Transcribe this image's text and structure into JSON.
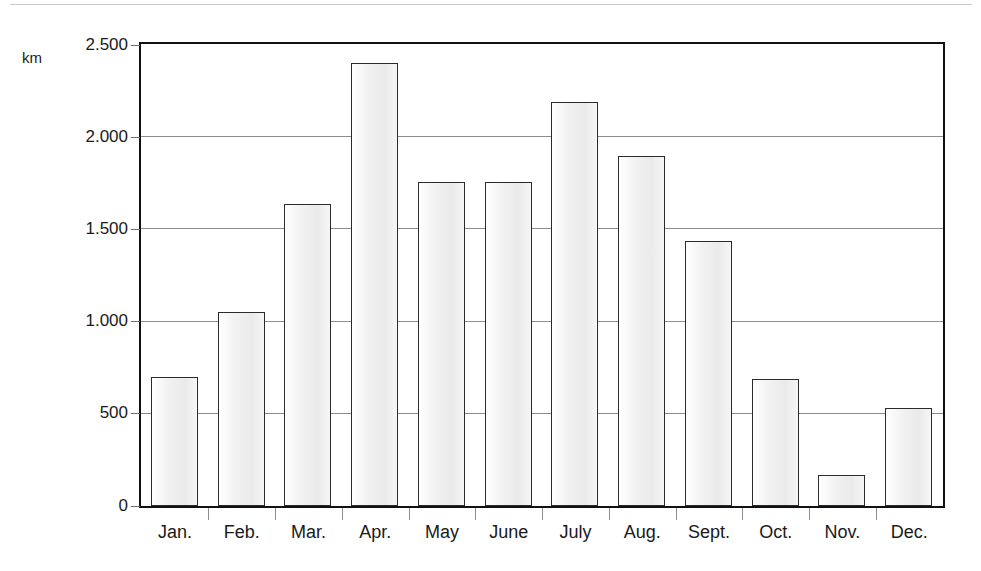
{
  "figure": {
    "unit_label": "km",
    "top_rule_color": "#c9c9c9",
    "frame_color": "#111111",
    "gridline_color": "#8d8d8d",
    "bar_fill_color": "#f0f0f0",
    "bar_border_color": "#2b2b2b",
    "text_color": "#1a1a1a"
  },
  "chart_data": {
    "type": "bar",
    "title": "",
    "subtitle": "",
    "xlabel": "",
    "ylabel": "km",
    "categories": [
      "Jan.",
      "Feb.",
      "Mar.",
      "Apr.",
      "May",
      "June",
      "July",
      "Aug.",
      "Sept.",
      "Oct.",
      "Nov.",
      "Dec."
    ],
    "values": [
      700,
      1050,
      1640,
      2400,
      1760,
      1760,
      2190,
      1900,
      1440,
      690,
      170,
      530
    ],
    "ylim": [
      0,
      2500
    ],
    "ytick_values": [
      0,
      500,
      1000,
      1500,
      2000,
      2500
    ],
    "ytick_labels": [
      "0",
      "500",
      "1.000",
      "1.500",
      "2.000",
      "2.500"
    ],
    "grid": "horizontal",
    "legend": "none",
    "series": [
      {
        "name": "km",
        "values": [
          700,
          1050,
          1640,
          2400,
          1760,
          1760,
          2190,
          1900,
          1440,
          690,
          170,
          530
        ]
      }
    ]
  }
}
